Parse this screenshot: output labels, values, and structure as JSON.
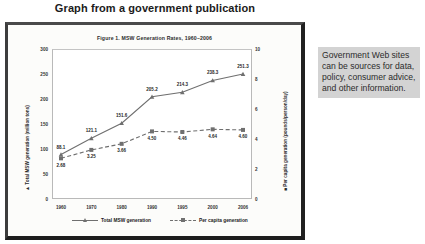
{
  "page": {
    "title": "Graph from a government publication"
  },
  "figure": {
    "caption": "Figure 1. MSW Generation Rates, 1960–2006",
    "left_axis_marker": "▲",
    "right_axis_marker": "■"
  },
  "side_note": {
    "text": "Government Web sites can be sources for data, policy, consumer advice, and other information."
  },
  "chart_data": {
    "type": "line",
    "title": "Figure 1. MSW Generation Rates, 1960–2006",
    "xlabel": "",
    "categories": [
      "1960",
      "1970",
      "1980",
      "1990",
      "1995",
      "2000",
      "2006"
    ],
    "grid": false,
    "legend_position": "bottom",
    "axes": {
      "left": {
        "label": "Total MSW generation (million tons)",
        "ticks": [
          "0",
          "50",
          "100",
          "150",
          "200",
          "250",
          "300"
        ],
        "lim": [
          0,
          300
        ]
      },
      "right": {
        "label": "Per capita generation (pounds/person/day)",
        "ticks": [
          "0",
          "2",
          "4",
          "6",
          "8",
          "10"
        ],
        "lim": [
          0,
          10
        ]
      }
    },
    "series": [
      {
        "name": "Total MSW generation",
        "axis": "left",
        "style": "solid",
        "marker": "triangle",
        "color": "#6f6f6f",
        "values": [
          88.1,
          121.1,
          151.6,
          205.2,
          214.3,
          238.3,
          251.3
        ],
        "labels": [
          "88.1",
          "121.1",
          "151.6",
          "205.2",
          "214.3",
          "238.3",
          "251.3"
        ]
      },
      {
        "name": "Per capita generation",
        "axis": "right",
        "style": "dashed",
        "marker": "square",
        "color": "#6f6f6f",
        "values": [
          2.68,
          3.25,
          3.66,
          4.5,
          4.46,
          4.64,
          4.6
        ],
        "labels": [
          "2.68",
          "3.25",
          "3.66",
          "4.50",
          "4.46",
          "4.64",
          "4.60"
        ]
      }
    ]
  }
}
